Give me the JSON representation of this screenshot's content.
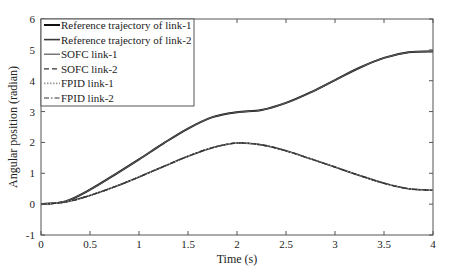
{
  "chart_data": {
    "type": "line",
    "title": "",
    "xlabel": "Time (s)",
    "ylabel": "Angular position (radian)",
    "xlim": [
      0,
      4
    ],
    "ylim": [
      -1,
      6
    ],
    "xticks": [
      0,
      0.5,
      1,
      1.5,
      2,
      2.5,
      3,
      3.5,
      4
    ],
    "xtick_labels": [
      "0",
      "0.5",
      "1",
      "1.5",
      "2",
      "2.5",
      "3",
      "3.5",
      "4"
    ],
    "yticks": [
      -1,
      0,
      1,
      2,
      3,
      4,
      5,
      6
    ],
    "ytick_labels": [
      "-1",
      "0",
      "1",
      "2",
      "3",
      "4",
      "5",
      "6"
    ],
    "grid": false,
    "legend_position": "top-left",
    "x": [
      0,
      0.25,
      0.5,
      0.75,
      1.0,
      1.25,
      1.5,
      1.75,
      2.0,
      2.25,
      2.5,
      2.75,
      3.0,
      3.25,
      3.5,
      3.75,
      4.0
    ],
    "series": [
      {
        "name": "Reference trajectory of link-1",
        "color": "#111111",
        "style": "solid",
        "values": [
          0,
          0.09,
          0.47,
          0.95,
          1.45,
          1.97,
          2.45,
          2.82,
          2.98,
          3.05,
          3.28,
          3.62,
          4.02,
          4.42,
          4.74,
          4.92,
          4.95
        ]
      },
      {
        "name": "Reference trajectory of link-2",
        "color": "#3a3a3a",
        "style": "solid",
        "values": [
          0,
          0.07,
          0.28,
          0.56,
          0.88,
          1.22,
          1.55,
          1.83,
          1.98,
          1.92,
          1.73,
          1.47,
          1.2,
          0.93,
          0.68,
          0.5,
          0.45
        ]
      },
      {
        "name": "SOFC link-1",
        "color": "#555555",
        "style": "solid",
        "values": [
          0,
          0.09,
          0.47,
          0.95,
          1.45,
          1.97,
          2.45,
          2.82,
          2.98,
          3.05,
          3.28,
          3.62,
          4.02,
          4.42,
          4.74,
          4.92,
          4.95
        ]
      },
      {
        "name": "SOFC link-2",
        "color": "#333333",
        "style": "dashed",
        "values": [
          0,
          0.07,
          0.28,
          0.56,
          0.88,
          1.22,
          1.55,
          1.83,
          1.98,
          1.92,
          1.73,
          1.47,
          1.2,
          0.93,
          0.68,
          0.5,
          0.45
        ]
      },
      {
        "name": "FPID link-1",
        "color": "#999999",
        "style": "dotted",
        "values": [
          0,
          0.07,
          0.28,
          0.56,
          0.88,
          1.22,
          1.55,
          1.83,
          1.98,
          1.92,
          1.73,
          1.47,
          1.2,
          0.93,
          0.68,
          0.5,
          0.45
        ]
      },
      {
        "name": "FPID link-2",
        "color": "#333333",
        "style": "dashdot",
        "values": [
          0,
          0.07,
          0.28,
          0.56,
          0.88,
          1.22,
          1.55,
          1.83,
          1.98,
          1.92,
          1.73,
          1.47,
          1.2,
          0.93,
          0.68,
          0.5,
          0.45
        ]
      }
    ]
  }
}
